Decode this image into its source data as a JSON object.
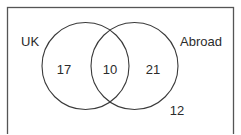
{
  "diagram": {
    "type": "venn",
    "title": "",
    "universal_set": {
      "name": "universal-set-rectangle",
      "outside_value": "12"
    },
    "sets": [
      {
        "id": "uk",
        "label": "UK",
        "only_value": "17",
        "center_x": 85.5,
        "center_y": 66,
        "radius": 43.5
      },
      {
        "id": "abroad",
        "label": "Abroad",
        "only_value": "21",
        "center_x": 134.5,
        "center_y": 66,
        "radius": 43.5
      }
    ],
    "intersection": {
      "label": "UK and Abroad",
      "value": "10"
    },
    "colors": {
      "circle_stroke": "#3a3a3a",
      "rect_stroke": "#555555",
      "text": "#2b2b2b",
      "background": "#ffffff"
    }
  }
}
